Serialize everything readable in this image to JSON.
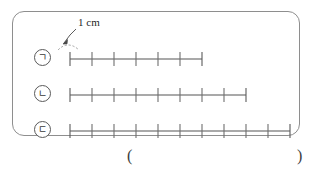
{
  "figure": {
    "name": "ruler-comparison-figure",
    "panel_border_color": "#8e8e8e",
    "tick_color": "#6e6e6e",
    "axis_color": "#555555"
  },
  "annotation": {
    "measure_label": "1 cm",
    "arrow_name": "annotation-arrow",
    "points_to": "first-segment-of-ruler-a"
  },
  "rulers": [
    {
      "id": "a",
      "label": "ㄱ",
      "segments": 6,
      "ticks": 7,
      "length_cm": 6,
      "unit_px": 22,
      "start_x": 15,
      "end_x": 147
    },
    {
      "id": "b",
      "label": "ㄴ",
      "segments": 8,
      "ticks": 9,
      "length_cm": 8,
      "unit_px": 22,
      "start_x": 15,
      "end_x": 191
    },
    {
      "id": "c",
      "label": "ㄷ",
      "segments": 10,
      "ticks": 11,
      "length_cm": 10,
      "unit_px": 22,
      "start_x": 15,
      "end_x": 235
    }
  ],
  "answer": {
    "open_paren": "(",
    "close_paren": ")"
  }
}
